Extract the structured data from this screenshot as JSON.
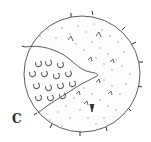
{
  "figure": {
    "panel_label": "C",
    "colors": {
      "outline": "#4a4a4a",
      "texture": "#9a9a9a",
      "spine": "#333333",
      "background": "#ffffff"
    }
  }
}
